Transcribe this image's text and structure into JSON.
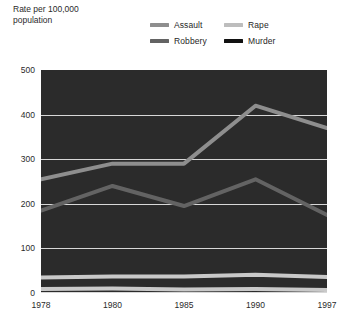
{
  "axis_title": "Rate per 100,000\npopulation",
  "legend": {
    "items": [
      {
        "label": "Assault",
        "color": "#8e8e8e"
      },
      {
        "label": "Rape",
        "color": "#bdbdbd"
      },
      {
        "label": "Robbery",
        "color": "#636363"
      },
      {
        "label": "Murder",
        "color": "#111111"
      }
    ]
  },
  "chart_data": {
    "type": "line",
    "title": "",
    "xlabel": "",
    "ylabel": "Rate per 100,000 population",
    "categories": [
      "1978",
      "1980",
      "1985",
      "1990",
      "1997"
    ],
    "ylim": [
      0,
      500
    ],
    "yticks": [
      0,
      100,
      200,
      300,
      400,
      500
    ],
    "grid": true,
    "legend_position": "top-right",
    "series": [
      {
        "name": "Assault",
        "color": "#8e8e8e",
        "values": [
          255,
          290,
          290,
          420,
          370
        ]
      },
      {
        "name": "Robbery",
        "color": "#636363",
        "values": [
          185,
          240,
          195,
          255,
          175
        ]
      },
      {
        "name": "Rape",
        "color": "#bdbdbd",
        "values": [
          35,
          37,
          37,
          41,
          36
        ]
      },
      {
        "name": "Murder",
        "color": "#111111",
        "values": [
          9,
          10,
          8,
          9,
          7
        ]
      }
    ]
  }
}
